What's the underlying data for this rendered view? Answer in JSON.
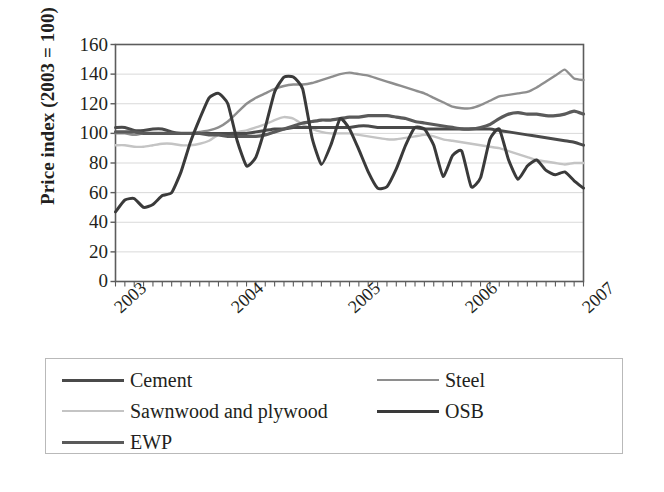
{
  "chart_data": {
    "type": "line",
    "title": "",
    "xlabel": "",
    "ylabel": "Price index (2003 = 100)",
    "ylim": [
      0,
      160
    ],
    "yticks": [
      0,
      20,
      40,
      60,
      80,
      100,
      120,
      140,
      160
    ],
    "xticks": [
      "2003",
      "2004",
      "2005",
      "2006",
      "2007"
    ],
    "xlim": [
      "2002-11",
      "2007-01"
    ],
    "x_tick_interval": "monthly",
    "grid": "horizontal",
    "legend_position": "below-plot",
    "x": [
      "2002-11",
      "2002-12",
      "2003-01",
      "2003-02",
      "2003-03",
      "2003-04",
      "2003-05",
      "2003-06",
      "2003-07",
      "2003-08",
      "2003-09",
      "2003-10",
      "2003-11",
      "2003-12",
      "2004-01",
      "2004-02",
      "2004-03",
      "2004-04",
      "2004-05",
      "2004-06",
      "2004-07",
      "2004-08",
      "2004-09",
      "2004-10",
      "2004-11",
      "2004-12",
      "2005-01",
      "2005-02",
      "2005-03",
      "2005-04",
      "2005-05",
      "2005-06",
      "2005-07",
      "2005-08",
      "2005-09",
      "2005-10",
      "2005-11",
      "2005-12",
      "2006-01",
      "2006-02",
      "2006-03",
      "2006-04",
      "2006-05",
      "2006-06",
      "2006-07",
      "2006-08",
      "2006-09",
      "2006-10",
      "2006-11",
      "2006-12",
      "2007-01"
    ],
    "series": [
      {
        "name": "Cement",
        "color": "#4a4a4a",
        "width": 3.0,
        "values": [
          104,
          104,
          102,
          102,
          103,
          103,
          101,
          100,
          100,
          100,
          100,
          100,
          100,
          100,
          100,
          101,
          102,
          103,
          103,
          104,
          104,
          104,
          104,
          104,
          104,
          104,
          105,
          105,
          104,
          104,
          104,
          104,
          104,
          103,
          103,
          103,
          103,
          103,
          103,
          103,
          103,
          102,
          101,
          100,
          99,
          98,
          97,
          96,
          95,
          94,
          92
        ]
      },
      {
        "name": "Steel",
        "color": "#8e8e8e",
        "width": 2.4,
        "values": [
          100,
          100,
          99,
          100,
          100,
          100,
          100,
          100,
          100,
          101,
          102,
          104,
          108,
          114,
          120,
          124,
          127,
          130,
          132,
          133,
          133,
          134,
          136,
          138,
          140,
          141,
          140,
          139,
          137,
          135,
          133,
          131,
          129,
          127,
          124,
          121,
          118,
          117,
          117,
          119,
          122,
          125,
          126,
          127,
          128,
          131,
          135,
          139,
          143,
          137,
          136
        ]
      },
      {
        "name": "Sawnwood and plywood",
        "color": "#c4c4c4",
        "width": 2.4,
        "values": [
          92,
          92,
          91,
          91,
          92,
          93,
          93,
          92,
          92,
          93,
          95,
          99,
          100,
          101,
          102,
          104,
          106,
          109,
          111,
          110,
          106,
          103,
          101,
          100,
          100,
          100,
          99,
          98,
          97,
          96,
          96,
          97,
          98,
          99,
          98,
          96,
          95,
          94,
          93,
          92,
          91,
          90,
          88,
          86,
          84,
          82,
          81,
          80,
          79,
          80,
          80
        ]
      },
      {
        "name": "OSB",
        "color": "#3a3a3a",
        "width": 3.0,
        "values": [
          47,
          55,
          56,
          50,
          52,
          58,
          60,
          74,
          94,
          110,
          124,
          127,
          120,
          95,
          78,
          84,
          104,
          128,
          138,
          138,
          130,
          97,
          79,
          92,
          110,
          103,
          89,
          74,
          63,
          64,
          76,
          92,
          104,
          103,
          92,
          71,
          85,
          88,
          64,
          70,
          96,
          103,
          82,
          69,
          78,
          82,
          75,
          72,
          74,
          68,
          63
        ]
      },
      {
        "name": "EWP",
        "color": "#5a5a5a",
        "width": 3.2,
        "values": [
          101,
          101,
          101,
          100,
          100,
          100,
          100,
          100,
          100,
          100,
          99,
          99,
          98,
          98,
          98,
          98,
          99,
          101,
          103,
          105,
          107,
          108,
          109,
          109,
          110,
          111,
          111,
          112,
          112,
          112,
          111,
          110,
          108,
          107,
          106,
          105,
          104,
          103,
          103,
          104,
          106,
          110,
          113,
          114,
          113,
          113,
          112,
          112,
          113,
          115,
          113
        ]
      }
    ]
  },
  "legend": {
    "entries": [
      {
        "label": "Cement",
        "color": "#4a4a4a",
        "width": 3.4
      },
      {
        "label": "Steel",
        "color": "#8e8e8e",
        "width": 2.6
      },
      {
        "label": "Sawnwood and plywood",
        "color": "#c4c4c4",
        "width": 2.4
      },
      {
        "label": "OSB",
        "color": "#3a3a3a",
        "width": 3.2
      },
      {
        "label": "EWP",
        "color": "#5a5a5a",
        "width": 3.6
      }
    ]
  },
  "axis": {
    "y_label": "Price index (2003 = 100)",
    "y_ticks": [
      "160",
      "140",
      "120",
      "100",
      "80",
      "60",
      "40",
      "20",
      "0"
    ],
    "x_ticks": [
      "2003",
      "2004",
      "2005",
      "2006",
      "2007"
    ]
  },
  "colors": {
    "axis_line": "#5c5c5c",
    "grid": "#d9d9d9",
    "text": "#231f20",
    "legend_border": "#b9b9b9"
  }
}
